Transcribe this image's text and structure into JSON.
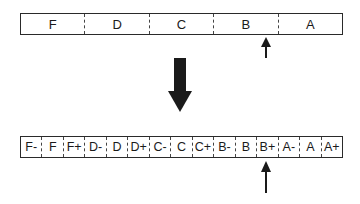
{
  "top_scale": {
    "grades": [
      "F",
      "D",
      "C",
      "B",
      "A"
    ],
    "marker_position_label": "between B and A (upper B)"
  },
  "transition_arrow": {
    "direction": "down"
  },
  "bottom_scale": {
    "grades": [
      "F-",
      "F",
      "F+",
      "D-",
      "D",
      "D+",
      "C-",
      "C",
      "C+",
      "B-",
      "B",
      "B+",
      "A-",
      "A",
      "A+"
    ],
    "marker_position_label": "B+"
  },
  "colors": {
    "ink": "#1a1a1a",
    "background": "#ffffff"
  }
}
